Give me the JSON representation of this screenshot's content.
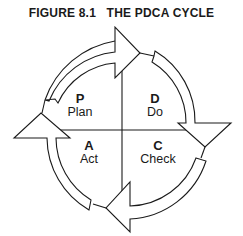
{
  "figure": {
    "title": "FIGURE 8.1   THE PDCA CYCLE"
  },
  "quadrants": [
    {
      "position": "top-left",
      "letter": "P",
      "label": "Plan"
    },
    {
      "position": "top-right",
      "letter": "D",
      "label": "Do"
    },
    {
      "position": "bottom-left",
      "letter": "A",
      "label": "Act"
    },
    {
      "position": "bottom-right",
      "letter": "C",
      "label": "Check"
    }
  ],
  "arrows": {
    "direction": "clockwise",
    "count": 4,
    "stroke_color": "#1a1a1a",
    "fill_color": "#ffffff"
  }
}
